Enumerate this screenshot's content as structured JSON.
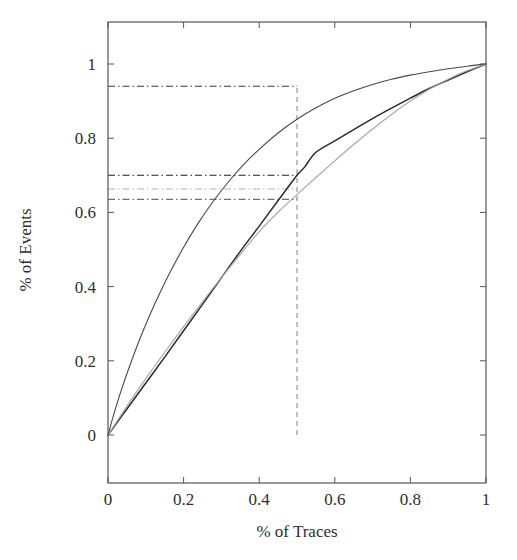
{
  "chart_data": {
    "type": "line",
    "title": "",
    "subtitle": "",
    "xlabel": "% of Traces",
    "ylabel": "% of Events",
    "xlim": [
      0,
      1
    ],
    "ylim": [
      0,
      1
    ],
    "grid": false,
    "legend": "none",
    "xticks": [
      "0",
      "0.2",
      "0.4",
      "0.6",
      "0.8",
      "1"
    ],
    "xtick_values": [
      0,
      0.2,
      0.4,
      0.6,
      0.8,
      1
    ],
    "yticks": [
      "0",
      "0.2",
      "0.4",
      "0.6",
      "0.8",
      "1"
    ],
    "ytick_values": [
      0,
      0.2,
      0.4,
      0.6,
      0.8,
      1
    ],
    "series": [
      {
        "name": "upper-concave-curve",
        "color": "#4a4a4a",
        "width": 1.1,
        "style": "solid",
        "x": [
          0,
          0.015,
          0.03,
          0.05,
          0.08,
          0.11,
          0.14,
          0.17,
          0.2,
          0.24,
          0.28,
          0.32,
          0.36,
          0.4,
          0.45,
          0.5,
          0.55,
          0.6,
          0.65,
          0.7,
          0.75,
          0.8,
          0.85,
          0.9,
          0.95,
          1
        ],
        "y": [
          0,
          0.055,
          0.105,
          0.165,
          0.248,
          0.322,
          0.389,
          0.45,
          0.506,
          0.573,
          0.632,
          0.684,
          0.73,
          0.77,
          0.814,
          0.851,
          0.882,
          0.908,
          0.928,
          0.945,
          0.959,
          0.97,
          0.979,
          0.987,
          0.994,
          1
        ]
      },
      {
        "name": "dark-lower-curve",
        "color": "#2b2b2b",
        "width": 1.5,
        "style": "solid",
        "x": [
          0,
          0.05,
          0.1,
          0.15,
          0.2,
          0.25,
          0.3,
          0.35,
          0.4,
          0.45,
          0.5,
          0.52,
          0.55,
          0.6,
          0.65,
          0.7,
          0.75,
          0.8,
          0.85,
          0.9,
          0.95,
          1
        ],
        "y": [
          0,
          0.07,
          0.14,
          0.21,
          0.281,
          0.352,
          0.424,
          0.495,
          0.563,
          0.632,
          0.7,
          0.722,
          0.762,
          0.793,
          0.823,
          0.853,
          0.881,
          0.908,
          0.934,
          0.957,
          0.979,
          1
        ]
      },
      {
        "name": "light-gray-curve",
        "color": "#a8a8a8",
        "width": 1.2,
        "style": "solid",
        "x": [
          0,
          0.05,
          0.1,
          0.15,
          0.2,
          0.25,
          0.3,
          0.35,
          0.4,
          0.45,
          0.5,
          0.55,
          0.6,
          0.65,
          0.7,
          0.75,
          0.8,
          0.85,
          0.9,
          0.95,
          1
        ],
        "y": [
          0,
          0.078,
          0.152,
          0.223,
          0.292,
          0.359,
          0.424,
          0.487,
          0.548,
          0.601,
          0.648,
          0.694,
          0.739,
          0.783,
          0.825,
          0.864,
          0.9,
          0.932,
          0.959,
          0.982,
          1
        ]
      }
    ],
    "reference_lines": [
      {
        "name": "vertical-marker-half",
        "orientation": "vertical",
        "value": 0.5,
        "from": 0,
        "to": 0.94,
        "style": "dashed",
        "color": "#8d8d8d"
      },
      {
        "name": "horizontal-marker-094",
        "orientation": "horizontal",
        "value": 0.94,
        "from": 0,
        "to": 0.5,
        "style": "dash-dot",
        "color": "#3a3a3a"
      },
      {
        "name": "horizontal-marker-070",
        "orientation": "horizontal",
        "value": 0.7,
        "from": 0,
        "to": 0.5,
        "style": "dash-dot",
        "color": "#1f1f1f"
      },
      {
        "name": "horizontal-marker-0663",
        "orientation": "horizontal",
        "value": 0.663,
        "from": 0,
        "to": 0.5,
        "style": "dash-dot",
        "color": "#b4b4b4"
      },
      {
        "name": "horizontal-marker-0635",
        "orientation": "horizontal",
        "value": 0.635,
        "from": 0,
        "to": 0.5,
        "style": "dash-dot",
        "color": "#6f6f6f"
      }
    ],
    "annotations": [],
    "axis_color": "#555555",
    "background": "#ffffff"
  }
}
